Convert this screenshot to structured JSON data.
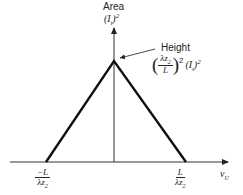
{
  "diagram": {
    "type": "triangle-function-plot",
    "y_axis_label_line1": "Area",
    "y_axis_label_line2": "(I",
    "y_axis_label_sub": "t",
    "y_axis_label_close": ")",
    "y_axis_label_exp": "2",
    "x_axis_label": "ν",
    "x_axis_label_sub": "U",
    "height_label": "Height",
    "height_formula": {
      "num_main": "λz",
      "num_sub": "2",
      "den": "L",
      "outer_exp": "2",
      "factor": "(I",
      "factor_sub": "t",
      "factor_close": ")",
      "factor_exp": "2"
    },
    "left_tick": {
      "num": "−L",
      "den_main": "λz",
      "den_sub": "2"
    },
    "right_tick": {
      "num": "L",
      "den_main": "λz",
      "den_sub": "2"
    },
    "colors": {
      "line": "#111111",
      "axis": "#333333",
      "text": "#222222"
    }
  }
}
